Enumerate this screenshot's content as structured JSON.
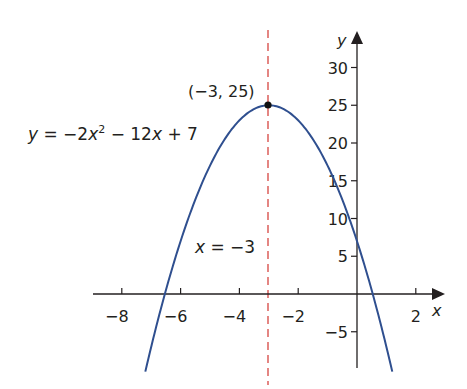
{
  "chart_data": {
    "type": "line",
    "title": "",
    "function": "y = -2x^2 - 12x + 7",
    "xlabel": "x",
    "ylabel": "y",
    "xlim": [
      -9.0,
      2.9
    ],
    "ylim": [
      -9.8,
      34.5
    ],
    "xticks": [
      -8,
      -6,
      -4,
      -2,
      2
    ],
    "xtick_labels": [
      "−8",
      "−6",
      "−4",
      "−2",
      "2"
    ],
    "yticks": [
      30,
      25,
      20,
      15,
      10,
      5,
      -5
    ],
    "ytick_labels": [
      "30",
      "25",
      "20",
      "15",
      "10",
      "5",
      "−5"
    ],
    "grid": false,
    "series": [
      {
        "name": "y = −2x² − 12x + 7",
        "color": "#2f4f8f",
        "x": [
          -7.2,
          -7,
          -6.5,
          -6,
          -5.5,
          -5,
          -4.5,
          -4,
          -3.5,
          -3,
          -2.5,
          -2,
          -1.5,
          -1,
          -0.5,
          0,
          0.5,
          1,
          1.2
        ],
        "values": [
          -9.28,
          -7,
          -0.5,
          7,
          13.5,
          17,
          20.5,
          23,
          24.5,
          25,
          24.5,
          23,
          20.5,
          17,
          12.5,
          7,
          0.5,
          -7,
          -10.28
        ]
      }
    ],
    "annotations": [
      {
        "type": "point",
        "x": -3,
        "y": 25,
        "label": "(−3, 25)"
      },
      {
        "type": "vline",
        "x": -3,
        "style": "dashed",
        "color": "#d9534f",
        "label": "x = −3"
      },
      {
        "type": "text",
        "label": "y = −2x² − 12x + 7"
      }
    ]
  },
  "labels": {
    "equation_y": "y",
    "equation_rest": " = −2",
    "equation_x": "x",
    "equation_sup": "2",
    "equation_tail1": " − 12",
    "equation_x2": "x",
    "equation_tail2": " + 7",
    "vertex": "(−3, 25)",
    "axis_line_x": "x",
    "axis_line_rest": " = −3",
    "x_axis": "x",
    "y_axis": "y"
  },
  "colors": {
    "curve": "#2f4f8f",
    "axis": "#231f20",
    "dashed": "#d9534f"
  }
}
